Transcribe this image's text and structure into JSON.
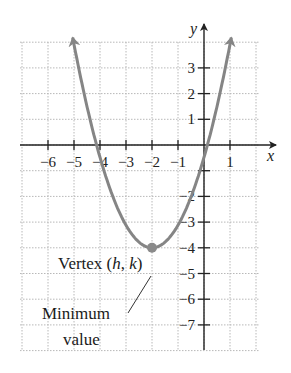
{
  "chart_data": {
    "type": "line",
    "title": "",
    "xlabel": "x",
    "ylabel": "y",
    "xlim": [
      -7,
      2
    ],
    "ylim": [
      -8,
      4
    ],
    "grid": true,
    "x_ticks": [
      -6,
      -5,
      -4,
      -3,
      -2,
      -1,
      1
    ],
    "y_ticks": [
      3,
      2,
      1,
      -2,
      -3,
      -4,
      -5,
      -6,
      -7
    ],
    "x_tick_labels": [
      "−6",
      "−5",
      "−4",
      "−3",
      "−2",
      "−1",
      "1"
    ],
    "y_tick_labels": [
      "3",
      "2",
      "1",
      "−2",
      "−3",
      "−4",
      "−5",
      "−6",
      "−7"
    ],
    "series": [
      {
        "name": "parabola",
        "equation": "y = a(x + 2)^2 - 4",
        "vertex": [
          -2,
          -4
        ],
        "x": [
          -5.1,
          -5,
          -4.5,
          -4,
          -3.5,
          -3,
          -2.5,
          -2,
          -1.5,
          -1,
          -0.5,
          0,
          0.5,
          1,
          1.1
        ],
        "y": [
          4.17,
          3.65,
          1.31,
          -0.6,
          -2.09,
          -3.15,
          -3.79,
          -4,
          -3.79,
          -3.15,
          -2.09,
          -0.6,
          1.31,
          3.65,
          4.17
        ],
        "color": "#858585",
        "arrows_at_ends": true
      }
    ],
    "annotations": [
      {
        "text": "Vertex (h, k)",
        "points_to": [
          -2,
          -4
        ]
      },
      {
        "text": "Minimum value",
        "points_to": [
          -2,
          -4
        ]
      }
    ]
  },
  "labels": {
    "x_axis": "x",
    "y_axis": "y",
    "vertex_prefix": "Vertex (",
    "vertex_h": "h",
    "vertex_sep": ", ",
    "vertex_k": "k",
    "vertex_suffix": ")",
    "minimum_line1": "Minimum",
    "minimum_line2": "value"
  },
  "colors": {
    "curve": "#858585",
    "axis": "#222222",
    "grid": "#b8b8b8"
  }
}
